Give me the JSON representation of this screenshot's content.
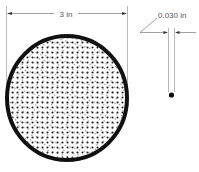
{
  "diagram": {
    "bundle": {
      "diameter_label": "3 in",
      "fill_pattern": "dense-dot-fibers",
      "border_color": "#111111"
    },
    "fiber": {
      "diameter_label": "0.030 in"
    }
  }
}
